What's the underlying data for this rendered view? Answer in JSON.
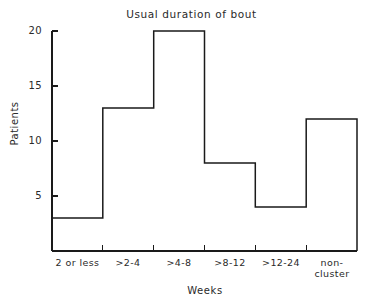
{
  "chart_data": {
    "type": "bar",
    "title": "Usual duration of bout",
    "xlabel": "Weeks",
    "ylabel": "Patients",
    "categories": [
      "2 or less",
      ">2-4",
      ">4-8",
      ">8-12",
      ">12-24",
      "non-\ncluster"
    ],
    "values": [
      3,
      13,
      20,
      8,
      4,
      12
    ],
    "ylim": [
      0,
      20
    ],
    "xlim": [
      0,
      6
    ],
    "yticks": [
      5,
      10,
      15,
      20
    ],
    "ytick_labels": [
      "5",
      "10",
      "15",
      "20"
    ],
    "grid": false,
    "legend": null,
    "style": {
      "line_color": "#1a1a1a",
      "fill_color": "none",
      "background": "#ffffff",
      "axis_color": "#1a1a1a",
      "line_width": 1.4
    }
  }
}
